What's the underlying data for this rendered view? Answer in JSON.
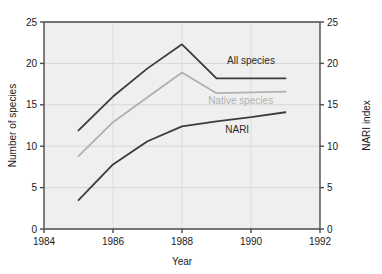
{
  "chart_data": {
    "type": "line",
    "title": "",
    "xlabel": "Year",
    "ylabel": "Number of species",
    "y2label": "NARI index",
    "xlim": [
      1984,
      1992
    ],
    "ylim": [
      0,
      25
    ],
    "y2lim": [
      0,
      25
    ],
    "xticks": [
      1984,
      1986,
      1988,
      1990,
      1992
    ],
    "xticklabels": [
      "1984",
      "1986",
      "1988",
      "1990",
      "1992"
    ],
    "yticks": [
      0,
      5,
      10,
      15,
      20,
      25
    ],
    "yticklabels": [
      "0",
      "5",
      "10",
      "15",
      "20",
      "25"
    ],
    "y2ticks": [
      0,
      5,
      10,
      15,
      20,
      25
    ],
    "y2ticklabels": [
      "0",
      "5",
      "10",
      "15",
      "20",
      "25"
    ],
    "grid": true,
    "grid_axis": "y",
    "legend": "inline-annotations",
    "series": [
      {
        "name": "All species",
        "color": "#3c3c3c",
        "axis": "left",
        "x": [
          1985,
          1986,
          1987,
          1988,
          1989,
          1990,
          1991
        ],
        "values": [
          11.9,
          16.0,
          19.4,
          22.3,
          18.2,
          18.2,
          18.2
        ],
        "label_x": 1990.0,
        "label_y": 19.9
      },
      {
        "name": "Native species",
        "color": "#b0b0b0",
        "axis": "left",
        "x": [
          1985,
          1986,
          1987,
          1988,
          1989,
          1990,
          1991
        ],
        "values": [
          8.8,
          12.9,
          15.9,
          18.9,
          16.4,
          16.5,
          16.6
        ],
        "label_x": 1989.7,
        "label_y": 15.1
      },
      {
        "name": "NARI",
        "color": "#3c3c3c",
        "axis": "right",
        "x": [
          1985,
          1986,
          1987,
          1988,
          1989,
          1990,
          1991
        ],
        "values": [
          3.5,
          7.8,
          10.6,
          12.4,
          13.0,
          13.5,
          14.1
        ],
        "label_x": 1989.6,
        "label_y": 11.6
      }
    ],
    "colors": {
      "plot_background": "#efefef",
      "axis": "#4a4a4a",
      "gridline": "#d7d7d7",
      "text": "#1a1a1a",
      "page_background": "#ffffff"
    }
  }
}
